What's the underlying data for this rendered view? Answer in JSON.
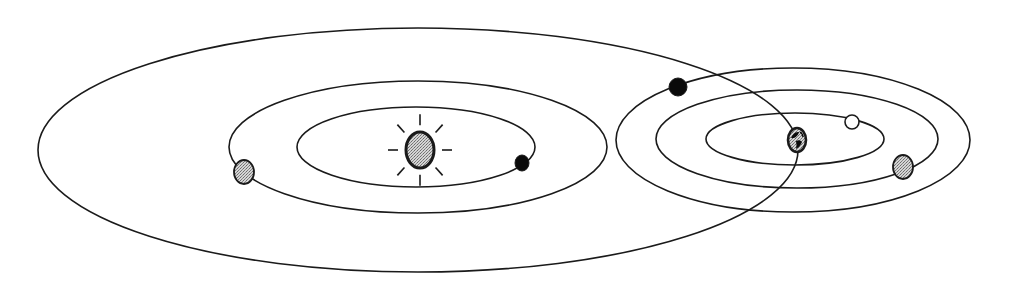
{
  "diagram": {
    "colors": {
      "stroke": "#1a1a1a",
      "background": "#ffffff",
      "shaded_fill": "#b8b8b8",
      "dark_fill": "#0a0a0a",
      "light_fill": "#ffffff"
    },
    "orbits": [
      {
        "id": "large-orbit",
        "cx": 418,
        "cy": 150,
        "rx": 380,
        "ry": 122
      },
      {
        "id": "sun-outer-orbit",
        "cx": 418,
        "cy": 147,
        "rx": 189,
        "ry": 66
      },
      {
        "id": "sun-inner-orbit",
        "cx": 416,
        "cy": 147,
        "rx": 119,
        "ry": 40
      },
      {
        "id": "earth-outer-orbit",
        "cx": 793,
        "cy": 140,
        "rx": 177,
        "ry": 72
      },
      {
        "id": "earth-middle-orbit",
        "cx": 797,
        "cy": 139,
        "rx": 141,
        "ry": 49
      },
      {
        "id": "earth-inner-orbit",
        "cx": 795,
        "cy": 139,
        "rx": 89,
        "ry": 26
      }
    ],
    "bodies": [
      {
        "id": "sun",
        "cx": 420,
        "cy": 150,
        "rx": 14,
        "ry": 18,
        "fill": "shaded",
        "rays": 8
      },
      {
        "id": "earth",
        "cx": 797,
        "cy": 140,
        "rx": 9,
        "ry": 12,
        "fill": "globe"
      },
      {
        "id": "planet-left-gray",
        "cx": 244,
        "cy": 172,
        "rx": 10,
        "ry": 12,
        "fill": "shaded"
      },
      {
        "id": "planet-inner-black",
        "cx": 522,
        "cy": 163,
        "rx": 7,
        "ry": 8,
        "fill": "dark"
      },
      {
        "id": "planet-top-black",
        "cx": 678,
        "cy": 87,
        "rx": 9,
        "ry": 9,
        "fill": "dark"
      },
      {
        "id": "moon-white",
        "cx": 852,
        "cy": 122,
        "rx": 7,
        "ry": 7,
        "fill": "light"
      },
      {
        "id": "planet-right-gray",
        "cx": 903,
        "cy": 167,
        "rx": 10,
        "ry": 12,
        "fill": "shaded"
      }
    ]
  }
}
